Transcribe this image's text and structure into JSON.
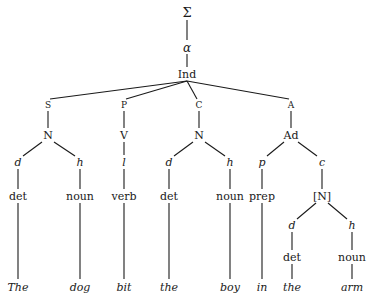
{
  "diagram": {
    "type": "syntax-tree",
    "root": {
      "id": "sigma",
      "label": "Σ",
      "x": 187,
      "y": 12,
      "cls": "big"
    },
    "nodes": [
      {
        "id": "sigma",
        "label": "Σ",
        "x": 187,
        "y": 12,
        "cls": "big"
      },
      {
        "id": "alpha",
        "label": "α",
        "x": 187,
        "y": 48,
        "cls": "greek"
      },
      {
        "id": "ind",
        "label": "Ind",
        "x": 187,
        "y": 74,
        "cls": "cat"
      },
      {
        "id": "S",
        "label": "S",
        "x": 48,
        "y": 105,
        "cls": "fn"
      },
      {
        "id": "P",
        "label": "P",
        "x": 124,
        "y": 105,
        "cls": "fn"
      },
      {
        "id": "C",
        "label": "C",
        "x": 199,
        "y": 105,
        "cls": "fn"
      },
      {
        "id": "A",
        "label": "A",
        "x": 291,
        "y": 105,
        "cls": "fn"
      },
      {
        "id": "N1",
        "label": "N",
        "x": 48,
        "y": 135,
        "cls": "cat"
      },
      {
        "id": "V",
        "label": "V",
        "x": 124,
        "y": 135,
        "cls": "cat"
      },
      {
        "id": "N2",
        "label": "N",
        "x": 199,
        "y": 135,
        "cls": "cat"
      },
      {
        "id": "Ad",
        "label": "Ad",
        "x": 291,
        "y": 135,
        "cls": "cat"
      },
      {
        "id": "d1",
        "label": "d",
        "x": 18,
        "y": 162,
        "cls": "rel"
      },
      {
        "id": "h1",
        "label": "h",
        "x": 80,
        "y": 162,
        "cls": "rel"
      },
      {
        "id": "l1",
        "label": "l",
        "x": 124,
        "y": 162,
        "cls": "rel"
      },
      {
        "id": "d2",
        "label": "d",
        "x": 169,
        "y": 162,
        "cls": "rel"
      },
      {
        "id": "h2",
        "label": "h",
        "x": 230,
        "y": 162,
        "cls": "rel"
      },
      {
        "id": "p1",
        "label": "p",
        "x": 262,
        "y": 162,
        "cls": "rel"
      },
      {
        "id": "c1",
        "label": "c",
        "x": 322,
        "y": 162,
        "cls": "rel"
      },
      {
        "id": "det1",
        "label": "det",
        "x": 18,
        "y": 196,
        "cls": "cat"
      },
      {
        "id": "noun1",
        "label": "noun",
        "x": 80,
        "y": 196,
        "cls": "cat"
      },
      {
        "id": "verb1",
        "label": "verb",
        "x": 124,
        "y": 196,
        "cls": "cat"
      },
      {
        "id": "det2",
        "label": "det",
        "x": 169,
        "y": 196,
        "cls": "cat"
      },
      {
        "id": "noun2",
        "label": "noun",
        "x": 230,
        "y": 196,
        "cls": "cat"
      },
      {
        "id": "prep1",
        "label": "prep",
        "x": 262,
        "y": 196,
        "cls": "cat"
      },
      {
        "id": "Nb",
        "label": "[N]",
        "x": 322,
        "y": 196,
        "cls": "cat"
      },
      {
        "id": "d3",
        "label": "d",
        "x": 292,
        "y": 225,
        "cls": "rel"
      },
      {
        "id": "h3",
        "label": "h",
        "x": 352,
        "y": 225,
        "cls": "rel"
      },
      {
        "id": "det3",
        "label": "det",
        "x": 292,
        "y": 257,
        "cls": "cat"
      },
      {
        "id": "noun3",
        "label": "noun",
        "x": 352,
        "y": 257,
        "cls": "cat"
      },
      {
        "id": "w1",
        "label": "The",
        "x": 18,
        "y": 287,
        "cls": "word"
      },
      {
        "id": "w2",
        "label": "dog",
        "x": 80,
        "y": 287,
        "cls": "word"
      },
      {
        "id": "w3",
        "label": "bit",
        "x": 124,
        "y": 287,
        "cls": "word"
      },
      {
        "id": "w4",
        "label": "the",
        "x": 169,
        "y": 287,
        "cls": "word"
      },
      {
        "id": "w5",
        "label": "boy",
        "x": 230,
        "y": 287,
        "cls": "word"
      },
      {
        "id": "w6",
        "label": "in",
        "x": 262,
        "y": 287,
        "cls": "word"
      },
      {
        "id": "w7",
        "label": "the",
        "x": 292,
        "y": 287,
        "cls": "word"
      },
      {
        "id": "w8",
        "label": "arm",
        "x": 352,
        "y": 287,
        "cls": "word"
      }
    ],
    "edges": [
      {
        "x1": 187,
        "y1": 20,
        "x2": 187,
        "y2": 40
      },
      {
        "x1": 187,
        "y1": 54,
        "x2": 187,
        "y2": 67
      },
      {
        "x1": 187,
        "y1": 81,
        "x2": 50,
        "y2": 99
      },
      {
        "x1": 187,
        "y1": 81,
        "x2": 126,
        "y2": 99
      },
      {
        "x1": 187,
        "y1": 81,
        "x2": 197,
        "y2": 99
      },
      {
        "x1": 187,
        "y1": 81,
        "x2": 289,
        "y2": 99
      },
      {
        "x1": 48,
        "y1": 111,
        "x2": 48,
        "y2": 128
      },
      {
        "x1": 124,
        "y1": 111,
        "x2": 124,
        "y2": 128
      },
      {
        "x1": 199,
        "y1": 111,
        "x2": 199,
        "y2": 128
      },
      {
        "x1": 291,
        "y1": 111,
        "x2": 291,
        "y2": 128
      },
      {
        "x1": 42,
        "y1": 142,
        "x2": 23,
        "y2": 156
      },
      {
        "x1": 54,
        "y1": 142,
        "x2": 75,
        "y2": 156
      },
      {
        "x1": 124,
        "y1": 142,
        "x2": 124,
        "y2": 155
      },
      {
        "x1": 193,
        "y1": 142,
        "x2": 174,
        "y2": 156
      },
      {
        "x1": 205,
        "y1": 142,
        "x2": 225,
        "y2": 156
      },
      {
        "x1": 284,
        "y1": 142,
        "x2": 267,
        "y2": 156
      },
      {
        "x1": 298,
        "y1": 142,
        "x2": 317,
        "y2": 156
      },
      {
        "x1": 18,
        "y1": 169,
        "x2": 18,
        "y2": 189
      },
      {
        "x1": 80,
        "y1": 169,
        "x2": 80,
        "y2": 189
      },
      {
        "x1": 124,
        "y1": 169,
        "x2": 124,
        "y2": 189
      },
      {
        "x1": 169,
        "y1": 169,
        "x2": 169,
        "y2": 189
      },
      {
        "x1": 230,
        "y1": 169,
        "x2": 230,
        "y2": 189
      },
      {
        "x1": 262,
        "y1": 169,
        "x2": 262,
        "y2": 189
      },
      {
        "x1": 322,
        "y1": 169,
        "x2": 322,
        "y2": 189
      },
      {
        "x1": 316,
        "y1": 203,
        "x2": 297,
        "y2": 219
      },
      {
        "x1": 328,
        "y1": 203,
        "x2": 347,
        "y2": 219
      },
      {
        "x1": 292,
        "y1": 232,
        "x2": 292,
        "y2": 250
      },
      {
        "x1": 352,
        "y1": 232,
        "x2": 352,
        "y2": 250
      },
      {
        "x1": 18,
        "y1": 203,
        "x2": 18,
        "y2": 279
      },
      {
        "x1": 80,
        "y1": 203,
        "x2": 80,
        "y2": 279
      },
      {
        "x1": 124,
        "y1": 203,
        "x2": 124,
        "y2": 279
      },
      {
        "x1": 169,
        "y1": 203,
        "x2": 169,
        "y2": 279
      },
      {
        "x1": 230,
        "y1": 203,
        "x2": 230,
        "y2": 279
      },
      {
        "x1": 262,
        "y1": 203,
        "x2": 262,
        "y2": 279
      },
      {
        "x1": 292,
        "y1": 264,
        "x2": 292,
        "y2": 279
      },
      {
        "x1": 352,
        "y1": 264,
        "x2": 352,
        "y2": 279
      }
    ],
    "sentence": [
      "The",
      "dog",
      "bit",
      "the",
      "boy",
      "in",
      "the",
      "arm"
    ],
    "line_color": "#1a1a1a"
  }
}
